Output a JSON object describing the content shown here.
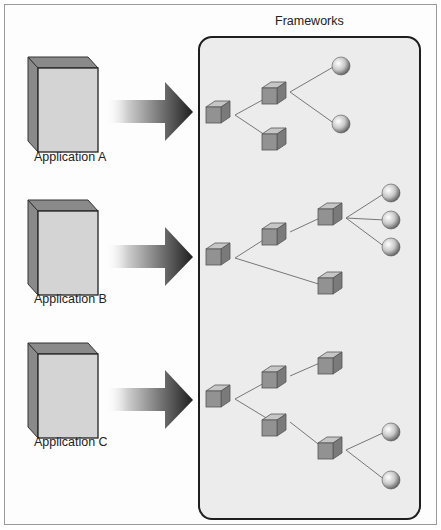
{
  "diagram": {
    "title": "Frameworks",
    "applications": [
      {
        "label": "Application A"
      },
      {
        "label": "Application B"
      },
      {
        "label": "Application C"
      }
    ],
    "framework_groups": [
      {
        "name": "framework-a",
        "cubes": 3,
        "spheres": 2
      },
      {
        "name": "framework-b",
        "cubes": 4,
        "spheres": 3
      },
      {
        "name": "framework-c",
        "cubes": 5,
        "spheres": 2
      }
    ],
    "colors": {
      "panel_fill": "#ececec",
      "panel_border": "#222222",
      "cube_face": "#8e8e8e",
      "cube_top": "#c4c4c4",
      "app_front": "#d2d2d2",
      "app_side": "#8a8a8a",
      "arrow_dark": "#2a2a2a"
    }
  }
}
